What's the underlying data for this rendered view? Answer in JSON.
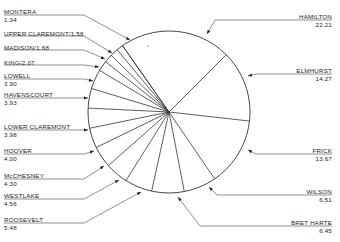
{
  "chart_data": {
    "type": "pie",
    "title": "",
    "categories": [
      "HAMILTON",
      "ELMHURST",
      "FRICK",
      "WILSON",
      "BRET HARTE",
      "ROOSEVELT",
      "WESTLAKE",
      "McCHESNEY",
      "HOOVER",
      "LOWER CLAREMONT",
      "HAVENSCOURT",
      "LOWELL",
      "KING",
      "MADISON",
      "UPPER CLAREMONT",
      "MONTERA"
    ],
    "values": [
      22.21,
      14.27,
      13.67,
      6.51,
      6.45,
      5.48,
      4.56,
      4.3,
      4.0,
      3.98,
      3.93,
      3.9,
      2.07,
      1.68,
      1.58,
      1.34
    ],
    "start_angle_deg": 125,
    "direction": "clockwise",
    "fill": "#ffffff",
    "stroke": "#333333",
    "legend": "none (callout labels with arrows)"
  },
  "labels": [
    {
      "name": "MONTERA",
      "value": "1.34",
      "side": "left",
      "inline": false,
      "x": 4,
      "y": 8,
      "ly": 15,
      "lineTo": [
        130,
        40
      ]
    },
    {
      "name": "UPPER CLAREMONT/1.58",
      "value": "",
      "side": "left",
      "inline": true,
      "x": 4,
      "y": 30,
      "ly": 36,
      "lineTo": [
        112,
        53
      ]
    },
    {
      "name": "MADISON/1.68",
      "value": "",
      "side": "left",
      "inline": true,
      "x": 4,
      "y": 44,
      "ly": 50,
      "lineTo": [
        105,
        59
      ]
    },
    {
      "name": "KING/2.07",
      "value": "",
      "side": "left",
      "inline": true,
      "x": 4,
      "y": 59,
      "ly": 65,
      "lineTo": [
        99,
        67
      ]
    },
    {
      "name": "LOWELL",
      "value": "3.90",
      "side": "left",
      "inline": false,
      "x": 4,
      "y": 72,
      "ly": 79,
      "lineTo": [
        93,
        81
      ]
    },
    {
      "name": "HAVENSCOURT",
      "value": "3.93",
      "side": "left",
      "inline": false,
      "x": 4,
      "y": 91,
      "ly": 98,
      "lineTo": [
        88,
        98
      ]
    },
    {
      "name": "LOWER CLAREMONT",
      "value": "3.98",
      "side": "left",
      "inline": false,
      "x": 4,
      "y": 123,
      "ly": 130,
      "lineTo": [
        88,
        130
      ]
    },
    {
      "name": "HOOVER",
      "value": "4.00",
      "side": "left",
      "inline": false,
      "x": 4,
      "y": 147,
      "ly": 154,
      "lineTo": [
        94,
        151
      ]
    },
    {
      "name": "McCHESNEY",
      "value": "4.30",
      "side": "left",
      "inline": false,
      "x": 4,
      "y": 172,
      "ly": 179,
      "lineTo": [
        104,
        166
      ]
    },
    {
      "name": "WESTLAKE",
      "value": "4.56",
      "side": "left",
      "inline": false,
      "x": 4,
      "y": 192,
      "ly": 199,
      "lineTo": [
        119,
        180
      ]
    },
    {
      "name": "ROOSEVELT",
      "value": "5.48",
      "side": "left",
      "inline": false,
      "x": 4,
      "y": 216,
      "ly": 223,
      "lineTo": [
        141,
        192
      ]
    },
    {
      "name": "HAMILTON",
      "value": "22.21",
      "side": "right",
      "inline": false,
      "x": 332,
      "y": 13,
      "ly": 20,
      "lineTo": [
        207,
        34
      ]
    },
    {
      "name": "ELMHURST",
      "value": "14.27",
      "side": "right",
      "inline": false,
      "x": 332,
      "y": 67,
      "ly": 74,
      "lineTo": [
        248,
        76
      ]
    },
    {
      "name": "FRICK",
      "value": "13.67",
      "side": "right",
      "inline": false,
      "x": 332,
      "y": 147,
      "ly": 154,
      "lineTo": [
        248,
        150
      ]
    },
    {
      "name": "WILSON",
      "value": "6.51",
      "side": "right",
      "inline": false,
      "x": 332,
      "y": 188,
      "ly": 195,
      "lineTo": [
        209,
        187
      ]
    },
    {
      "name": "BRET HARTE",
      "value": "6.45",
      "side": "right",
      "inline": false,
      "x": 332,
      "y": 219,
      "ly": 226,
      "lineTo": [
        178,
        197
      ]
    }
  ]
}
